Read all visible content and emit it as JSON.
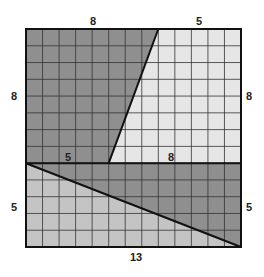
{
  "diagram": {
    "title": "",
    "grid": {
      "columns": 13,
      "rows": 13
    },
    "colors": {
      "dark_fill": "#8f8f8f",
      "light_fill": "#e6e6e6",
      "medium_fill": "#c4c4c4",
      "grid_line": "#333333",
      "thick_line": "#111111"
    },
    "labels": {
      "top_left": "8",
      "top_right": "5",
      "left_upper": "8",
      "right_upper": "8",
      "middle_left": "5",
      "middle_right": "8",
      "left_lower": "5",
      "right_lower": "5",
      "bottom": "13"
    },
    "regions": [
      {
        "name": "upper-left-trapezoid",
        "shade": "dark"
      },
      {
        "name": "upper-right-trapezoid",
        "shade": "light"
      },
      {
        "name": "lower-upper-triangle",
        "shade": "dark"
      },
      {
        "name": "lower-lower-triangle",
        "shade": "medium"
      }
    ]
  }
}
